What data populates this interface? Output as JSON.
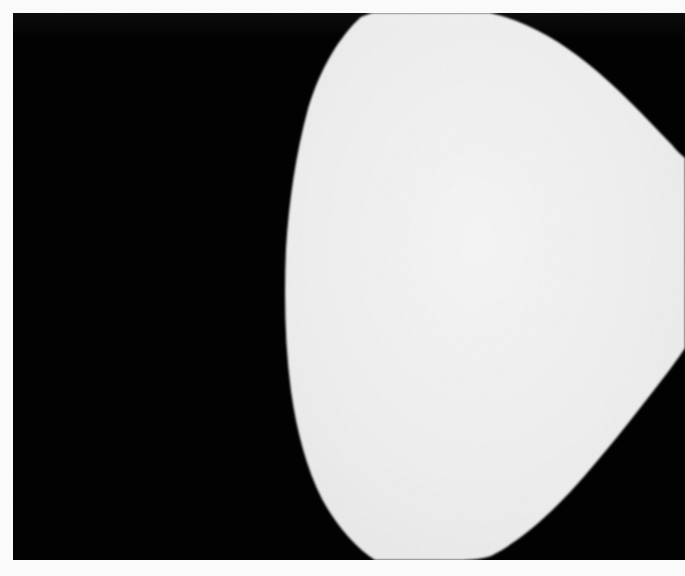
{
  "document": {
    "kind": "scanned-photographic-plate",
    "width_px": 685,
    "height_px": 576,
    "description": "High-contrast black and white scanned plate: a large pale lens-shaped form on a solid black field, framed by a white paper margin.",
    "caption": "",
    "page_number": ""
  },
  "colors": {
    "paper_white": "#fdfdfd",
    "plate_black": "#020202",
    "figure_light": "#f0f0f0",
    "figure_light_core": "#f5f5f5",
    "figure_shadow": "#e2e2e2"
  },
  "plate": {
    "left": 13,
    "top": 13,
    "width": 672,
    "height": 547,
    "background": "#020202"
  },
  "figure": {
    "name": "pale-curved-form",
    "fill": "#f0f0f0",
    "outline_points": "372,0 410,0 450,1 490,2 520,10 552,28 585,56 618,92 648,128 672,148 672,176 672,228 672,290 672,330 648,368 614,410 578,452 540,490 500,522 462,544 420,547 388,547 360,534 334,506 312,470 296,430 284,386 277,330 276,272 280,216 292,158 310,104 336,50",
    "touches_top_edge": true,
    "touches_right_edge": true,
    "touches_bottom_edge": true,
    "leftmost_x": 276,
    "apex_top_span": "372-490"
  }
}
